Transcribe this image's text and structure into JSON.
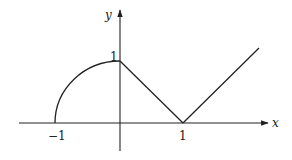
{
  "diagram": {
    "axes": {
      "x_label": "x",
      "y_label": "y"
    },
    "ticks": {
      "x_neg_one": "−1",
      "x_one": "1",
      "y_one": "1"
    },
    "colors": {
      "stroke": "#222222",
      "background": "#ffffff"
    }
  }
}
